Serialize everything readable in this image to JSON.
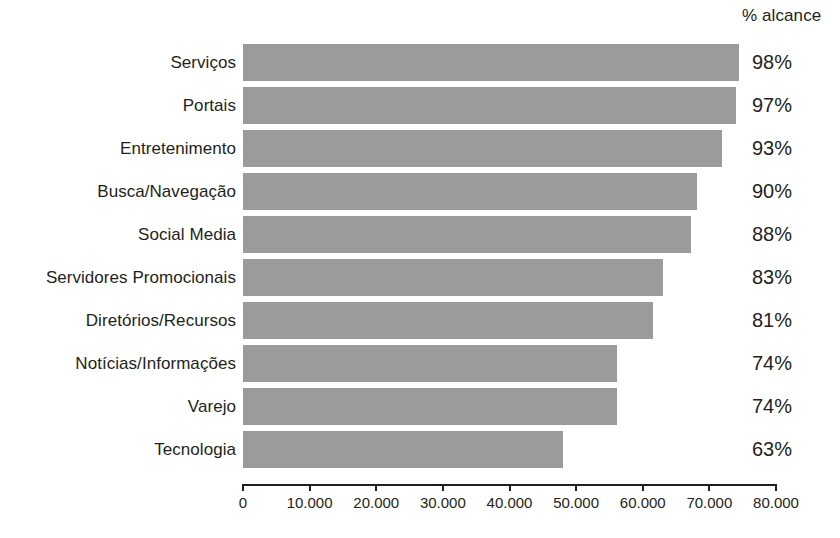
{
  "header": {
    "pct_column_title": "% alcance"
  },
  "chart_data": {
    "type": "bar",
    "orientation": "horizontal",
    "title": "",
    "subtitle": "",
    "xlabel": "",
    "ylabel": "",
    "grid": false,
    "legend": null,
    "xlim": [
      0,
      80000
    ],
    "xticks": [
      0,
      10000,
      20000,
      30000,
      40000,
      50000,
      60000,
      70000,
      80000
    ],
    "xtick_labels": [
      "0",
      "10.000",
      "20.000",
      "30.000",
      "40.000",
      "50.000",
      "60.000",
      "70.000",
      "80.000"
    ],
    "bar_color": "#9b9b9b",
    "text_color": "#231f20",
    "background": "#ffffff",
    "categories": [
      "Serviços",
      "Portais",
      "Entretenimento",
      "Busca/Navegação",
      "Social Media",
      "Servidores Promocionais",
      "Diretórios/Recursos",
      "Notícias/Informações",
      "Varejo",
      "Tecnologia"
    ],
    "values": [
      74400,
      74000,
      71900,
      68200,
      67300,
      63100,
      61600,
      56200,
      56200,
      48000
    ],
    "annotations": {
      "label": "% alcance",
      "values": [
        "98%",
        "97%",
        "93%",
        "90%",
        "88%",
        "83%",
        "81%",
        "74%",
        "74%",
        "63%"
      ]
    },
    "rows": [
      {
        "category": "Serviços",
        "value": 74400,
        "percent": "98%"
      },
      {
        "category": "Portais",
        "value": 74000,
        "percent": "97%"
      },
      {
        "category": "Entretenimento",
        "value": 71900,
        "percent": "93%"
      },
      {
        "category": "Busca/Navegação",
        "value": 68200,
        "percent": "90%"
      },
      {
        "category": "Social Media",
        "value": 67300,
        "percent": "88%"
      },
      {
        "category": "Servidores Promocionais",
        "value": 63100,
        "percent": "83%"
      },
      {
        "category": "Diretórios/Recursos",
        "value": 61600,
        "percent": "81%"
      },
      {
        "category": "Notícias/Informações",
        "value": 56200,
        "percent": "74%"
      },
      {
        "category": "Varejo",
        "value": 56200,
        "percent": "74%"
      },
      {
        "category": "Tecnologia",
        "value": 48000,
        "percent": "63%"
      }
    ]
  }
}
